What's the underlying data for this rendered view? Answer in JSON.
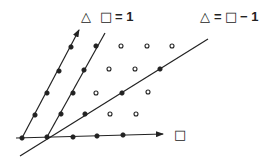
{
  "labels": {
    "top_left_triangle": "△",
    "top_left_square": "□",
    "top_left_eq": "= 1",
    "top_right_triangle": "△",
    "top_right_eq1": "=",
    "top_right_square": "□",
    "top_right_eq2": "− 1",
    "x_axis_square": "□"
  },
  "colors": {
    "ink": "#222222",
    "background": "#ffffff"
  },
  "lines": [
    {
      "name": "line-square-eq-0",
      "from": [
        22,
        138
      ],
      "to": [
        79,
        30
      ],
      "arrow": true
    },
    {
      "name": "line-square-eq-1",
      "from": [
        47,
        137
      ],
      "to": [
        105,
        33
      ],
      "arrow": false
    },
    {
      "name": "line-triangle-eq-square-minus-1",
      "from": [
        20,
        156
      ],
      "to": [
        208,
        39
      ],
      "arrow": false
    },
    {
      "name": "horizontal-axis",
      "from": [
        16,
        138
      ],
      "to": [
        163,
        134
      ],
      "arrow": true
    }
  ],
  "filled_points": [
    [
      22,
      138
    ],
    [
      35,
      115
    ],
    [
      47,
      93
    ],
    [
      59,
      71
    ],
    [
      71,
      47
    ],
    [
      47,
      137
    ],
    [
      61,
      114
    ],
    [
      73,
      93
    ],
    [
      84,
      70
    ],
    [
      96,
      46
    ],
    [
      85,
      114
    ],
    [
      122,
      93
    ],
    [
      160,
      69
    ],
    [
      73,
      137
    ],
    [
      97,
      136
    ],
    [
      123,
      135
    ]
  ],
  "open_points": [
    [
      121,
      46
    ],
    [
      147,
      46
    ],
    [
      172,
      46
    ],
    [
      109,
      69
    ],
    [
      135,
      69
    ],
    [
      96,
      93
    ],
    [
      148,
      92
    ],
    [
      110,
      114
    ],
    [
      136,
      114
    ]
  ]
}
